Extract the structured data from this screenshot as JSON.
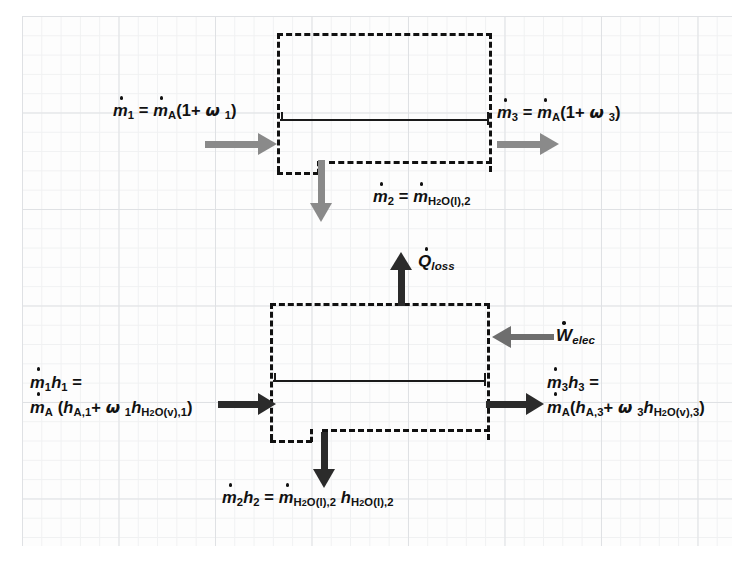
{
  "diagram": {
    "background": "graph-paper",
    "colors": {
      "mass_arrow": "#8a8a8a",
      "energy_arrow": "#2b2b2b",
      "boundary": "#111111",
      "grid_minor": "#f0f1f2",
      "grid_major": "#dfe1e4"
    }
  },
  "mass_balance": {
    "name": "mass-balance-control-volume",
    "inlet": {
      "label_lhs": "m",
      "label_lhs_sub": "1",
      "equals": "=",
      "rhs_symbol": "m",
      "rhs_sub": "A",
      "rhs_paren_open": "(1+",
      "rhs_omega": "ω",
      "rhs_omega_sub": "1",
      "rhs_paren_close": ")",
      "full_text": "ṁ1 = ṁA(1+ ω1)",
      "arrow_direction": "right",
      "arrow_color": "#8a8a8a"
    },
    "outlet": {
      "label_lhs": "m",
      "label_lhs_sub": "3",
      "equals": "=",
      "rhs_symbol": "m",
      "rhs_sub": "A",
      "rhs_paren_open": "(1+",
      "rhs_omega": "ω",
      "rhs_omega_sub": "3",
      "rhs_paren_close": ")",
      "full_text": "ṁ3 = ṁA(1+ ω3)",
      "arrow_direction": "right",
      "arrow_color": "#8a8a8a"
    },
    "condensate": {
      "label_lhs": "m",
      "label_lhs_sub": "2",
      "equals": "=",
      "rhs_symbol": "m",
      "rhs_sub": "H2O(l),2",
      "full_text": "ṁ2 = ṁH2O(l),2",
      "arrow_direction": "down",
      "arrow_color": "#8a8a8a"
    }
  },
  "energy_balance": {
    "name": "energy-balance-control-volume",
    "heat_loss": {
      "symbol": "Q",
      "subscript": "loss",
      "full_text": "Q̇loss",
      "arrow_direction": "up",
      "arrow_color": "#2b2b2b"
    },
    "electrical_work": {
      "symbol": "W",
      "subscript": "elec",
      "full_text": "Ẇelec",
      "arrow_direction": "left",
      "arrow_color": "#6e6e6e"
    },
    "inlet": {
      "line1_lhs": "m",
      "line1_lhs_sub": "1",
      "line1_h": "h",
      "line1_h_sub": "1",
      "line1_equals": "=",
      "line2_symbol": "m",
      "line2_sub": "A",
      "line2_open": "(",
      "line2_h": "h",
      "line2_h_sub": "A,1",
      "line2_plus": "+",
      "line2_omega": "ω",
      "line2_omega_sub": "1",
      "line2_h2": "h",
      "line2_h2_sub": "H2O(v),1",
      "line2_close": ")",
      "full_text": "ṁ1h1 = ṁA (hA,1+ ω1hH2O(v),1)",
      "arrow_direction": "right",
      "arrow_color": "#2b2b2b"
    },
    "outlet": {
      "line1_lhs": "m",
      "line1_lhs_sub": "3",
      "line1_h": "h",
      "line1_h_sub": "3",
      "line1_equals": "=",
      "line2_symbol": "m",
      "line2_sub": "A",
      "line2_open": "(",
      "line2_h": "h",
      "line2_h_sub": "A,3",
      "line2_plus": "+",
      "line2_omega": "ω",
      "line2_omega_sub": "3",
      "line2_h2": "h",
      "line2_h2_sub": "H2O(v),3",
      "line2_close": ")",
      "full_text": "ṁ3h3 = ṁA(hA,3+ ω3hH2O(v),3)",
      "arrow_direction": "right",
      "arrow_color": "#2b2b2b"
    },
    "condensate": {
      "lhs_symbol": "m",
      "lhs_sub": "2",
      "lhs_h": "h",
      "lhs_h_sub": "2",
      "equals": "=",
      "rhs_symbol": "m",
      "rhs_sub": "H2O(l),2",
      "rhs_h": "h",
      "rhs_h_sub": "H2O(l),2",
      "full_text": "ṁ2h2 = ṁH2O(l),2 hH2O(l),2",
      "arrow_direction": "down",
      "arrow_color": "#2b2b2b"
    }
  }
}
